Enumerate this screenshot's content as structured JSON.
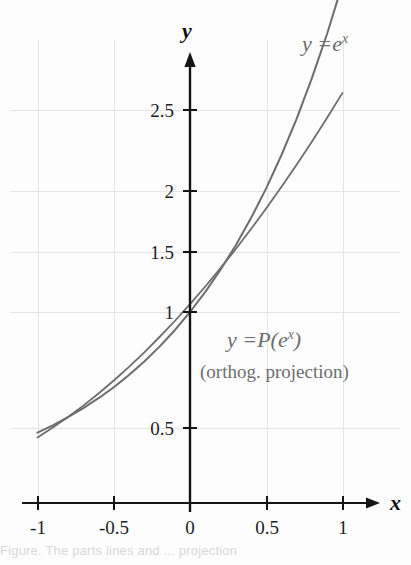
{
  "figure": {
    "background_color": "#fdfdfd",
    "curve_color": "#6d6d6d",
    "axis_color": "#141414",
    "grid_color": "#e3e3e6"
  },
  "axes": {
    "y_axis_name": "y",
    "x_axis_name": "x"
  },
  "labels": {
    "exp_curve": {
      "lhs": "y =",
      "base": "e",
      "exponent": "x",
      "full": "y = e^x"
    },
    "proj_curve": {
      "lhs": "y =",
      "operator": "P",
      "open_paren": "(",
      "base": "e",
      "exponent": "x",
      "close_paren": ")",
      "full": "y = P(e^x)"
    },
    "proj_sub": "(orthog. projection)"
  },
  "caption": {
    "partial_text": "Figure. The parts lines and ... projection"
  },
  "chart_data": {
    "type": "line",
    "title": "",
    "xlabel": "x",
    "ylabel": "y",
    "xlim": [
      -1.0,
      1.0
    ],
    "ylim": [
      0.0,
      2.85
    ],
    "grid": true,
    "legend_position": "inline-annotation",
    "x_ticks": [
      -1,
      -0.5,
      0,
      0.5,
      1
    ],
    "x_tick_labels": [
      "-1",
      "-0.5",
      "0",
      "0.5",
      "1"
    ],
    "y_ticks": [
      0.5,
      1,
      1.5,
      2,
      2.5
    ],
    "y_tick_labels": [
      "0.5",
      "1",
      "1.5",
      "2",
      "2.5"
    ],
    "x": [
      -1.0,
      -0.9,
      -0.8,
      -0.7,
      -0.6,
      -0.5,
      -0.4,
      -0.3,
      -0.2,
      -0.1,
      0.0,
      0.1,
      0.2,
      0.3,
      0.4,
      0.5,
      0.6,
      0.7,
      0.8,
      0.9,
      1.0
    ],
    "series": [
      {
        "name": "y = e^x",
        "color": "#6d6d6d",
        "values": [
          0.3679,
          0.4066,
          0.4493,
          0.4966,
          0.5488,
          0.6065,
          0.6703,
          0.7408,
          0.8187,
          0.9048,
          1.0,
          1.1052,
          1.2214,
          1.3499,
          1.4918,
          1.6487,
          1.8221,
          2.0138,
          2.2255,
          2.4596,
          2.7183
        ]
      },
      {
        "name": "y = P(e^x)",
        "color": "#6d6d6d",
        "values": [
          0.3435,
          0.3948,
          0.4503,
          0.5098,
          0.5735,
          0.6412,
          0.713,
          0.7889,
          0.8689,
          0.953,
          1.0411,
          1.1333,
          1.2296,
          1.33,
          1.4345,
          1.543,
          1.6557,
          1.7724,
          1.8932,
          2.0181,
          2.1471
        ]
      }
    ],
    "annotations": [
      {
        "text": "y = e^x",
        "x": 0.78,
        "y": 2.82
      },
      {
        "text": "y = P(e^x)",
        "x": 0.3,
        "y": 1.03
      },
      {
        "text": "(orthog. projection)",
        "x": 0.22,
        "y": 0.83
      }
    ]
  }
}
